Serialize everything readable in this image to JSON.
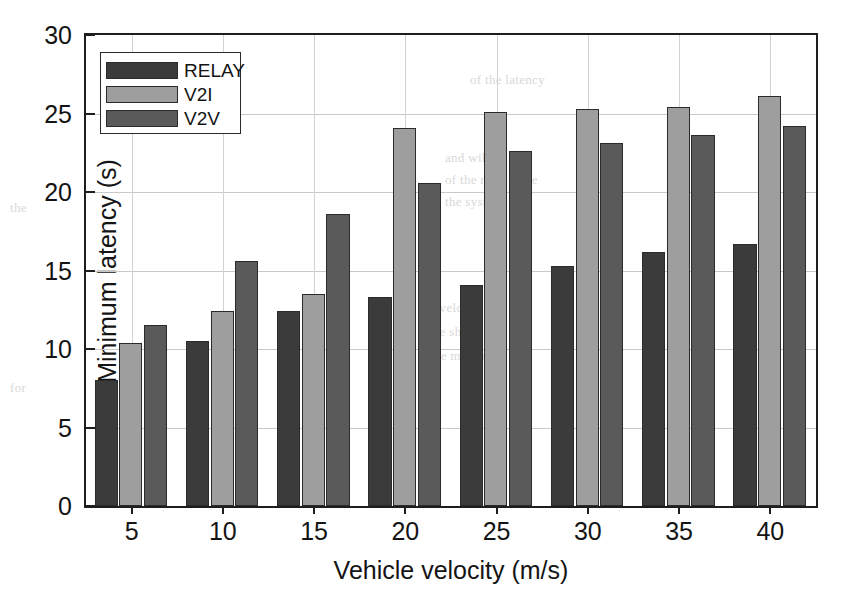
{
  "chart_data": {
    "type": "bar",
    "title": "",
    "xlabel": "Vehicle velocity (m/s)",
    "ylabel": "Minimum latency (s)",
    "categories": [
      "5",
      "10",
      "15",
      "20",
      "25",
      "30",
      "35",
      "40"
    ],
    "xlim": [
      2.5,
      42.5
    ],
    "ylim": [
      0,
      30
    ],
    "yticks": [
      0,
      5,
      10,
      15,
      20,
      25,
      30
    ],
    "ytick_labels": [
      "0",
      "5",
      "10",
      "15",
      "20",
      "25",
      "30"
    ],
    "xticks": [
      5,
      10,
      15,
      20,
      25,
      30,
      35,
      40
    ],
    "xtick_labels": [
      "5",
      "10",
      "15",
      "20",
      "25",
      "30",
      "35",
      "40"
    ],
    "grid": true,
    "legend_position": "upper left",
    "series": [
      {
        "name": "RELAY",
        "color": "#3b3b3b",
        "values": [
          8.0,
          10.5,
          12.4,
          13.3,
          14.1,
          15.3,
          16.2,
          16.7
        ]
      },
      {
        "name": "V2I",
        "color": "#9e9e9e",
        "values": [
          10.4,
          12.4,
          13.5,
          24.1,
          25.1,
          25.3,
          25.4,
          26.1
        ]
      },
      {
        "name": "V2V",
        "color": "#5a5a5a",
        "values": [
          11.5,
          15.6,
          18.6,
          20.6,
          22.6,
          23.1,
          23.6,
          24.2
        ]
      }
    ]
  },
  "bleed_text": [
    {
      "x": 470,
      "y": 72,
      "text": "of the latency"
    },
    {
      "x": 445,
      "y": 150,
      "text": "and will be the"
    },
    {
      "x": 445,
      "y": 172,
      "text": "of the relay node"
    },
    {
      "x": 445,
      "y": 194,
      "text": "the system"
    },
    {
      "x": 430,
      "y": 300,
      "text": "a velocity"
    },
    {
      "x": 430,
      "y": 324,
      "text": "we show"
    },
    {
      "x": 430,
      "y": 348,
      "text": "the minimum"
    },
    {
      "x": 10,
      "y": 200,
      "text": "the"
    },
    {
      "x": 10,
      "y": 380,
      "text": "for"
    }
  ]
}
